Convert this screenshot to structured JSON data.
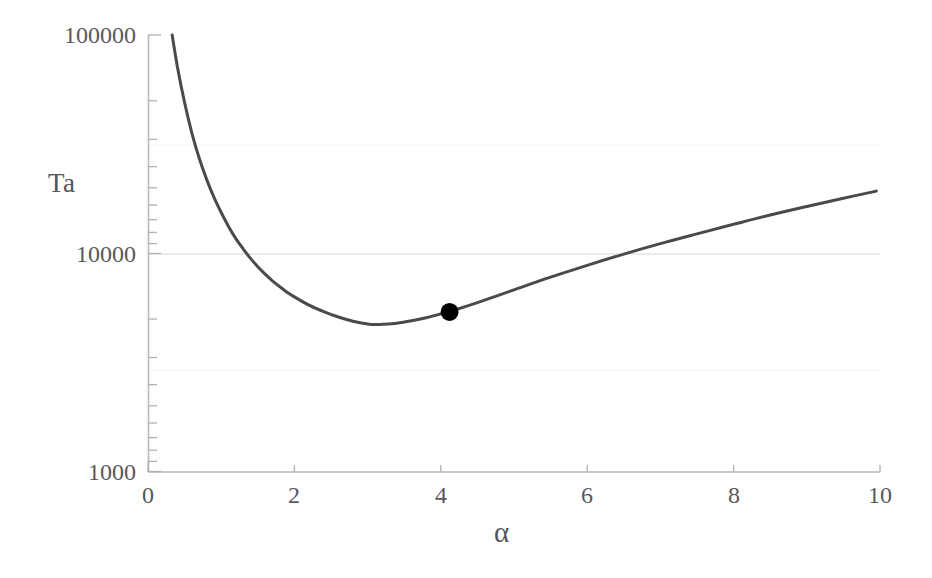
{
  "chart_data": {
    "type": "line",
    "title": "",
    "xlabel": "α",
    "ylabel": "Ta",
    "xscale": "linear",
    "yscale": "log",
    "xlim": [
      0,
      10
    ],
    "ylim": [
      1000,
      100000
    ],
    "grid": "minor-horizontal-faint",
    "legend": "none",
    "xticks": [
      0,
      2,
      4,
      6,
      8,
      10
    ],
    "xtick_labels": [
      "0",
      "2",
      "4",
      "6",
      "8",
      "10"
    ],
    "yticks": [
      1000,
      10000,
      100000
    ],
    "ytick_labels": [
      "1000",
      "10000",
      "100000"
    ],
    "series": [
      {
        "name": "critical Taylor number curve",
        "type": "line",
        "color": "#4a4a4a",
        "linewidth": 3,
        "x": [
          0.33,
          0.4,
          0.5,
          0.6,
          0.7,
          0.8,
          0.9,
          1.0,
          1.1,
          1.2,
          1.3,
          1.4,
          1.5,
          1.6,
          1.7,
          1.8,
          1.9,
          2.0,
          2.2,
          2.4,
          2.6,
          2.8,
          3.0,
          3.12,
          3.2,
          3.4,
          3.6,
          3.8,
          4.0,
          4.2,
          4.5,
          5.0,
          5.5,
          6.0,
          6.5,
          7.0,
          7.5,
          8.0,
          8.5,
          9.0,
          9.5,
          9.95
        ],
        "y": [
          100000,
          72000,
          49000,
          35500,
          27300,
          21900,
          18100,
          15400,
          13300,
          11700,
          10500,
          9500,
          8700,
          8050,
          7500,
          7050,
          6650,
          6330,
          5800,
          5420,
          5120,
          4900,
          4760,
          4730,
          4740,
          4800,
          4920,
          5080,
          5290,
          5530,
          5960,
          6820,
          7790,
          8830,
          9940,
          11100,
          12300,
          13600,
          15000,
          16400,
          17900,
          19300
        ]
      },
      {
        "name": "experimental point",
        "type": "scatter",
        "color": "#000000",
        "marker": "filled-circle",
        "marker_size": 18,
        "points": [
          {
            "x": 4.12,
            "y": 5400
          }
        ]
      }
    ]
  },
  "axes": {
    "frame_color": "#b9b9bd",
    "tick_color": "#b0b0b4",
    "gridline_color": "#e6e2e6",
    "background": "#ffffff"
  }
}
